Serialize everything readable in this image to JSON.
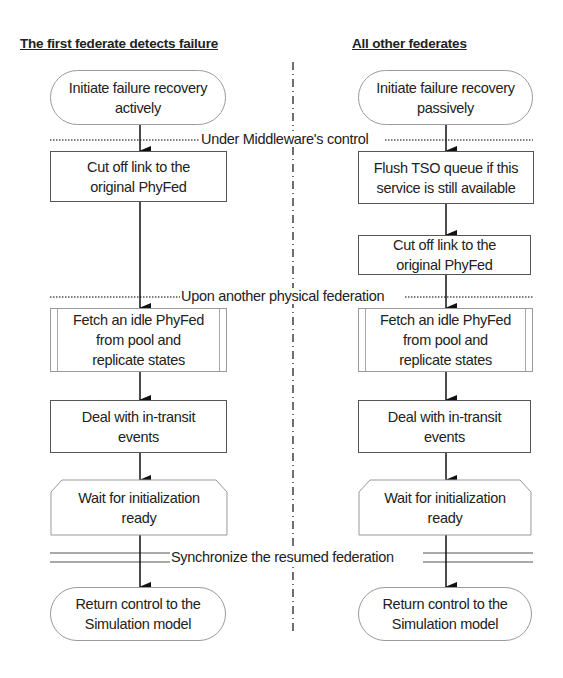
{
  "diagram": {
    "lanes": [
      {
        "id": "left",
        "header": "The first federate detects failure",
        "steps": [
          {
            "shape": "terminator",
            "text": "Initiate failure recovery actively",
            "lines": [
              "Initiate failure recovery",
              "actively"
            ]
          },
          {
            "shape": "process",
            "text": "Cut off link to the original PhyFed",
            "lines": [
              "Cut off link to the",
              "original PhyFed"
            ]
          },
          {
            "shape": "predefined-process",
            "text": "Fetch an idle PhyFed from pool and replicate states",
            "lines": [
              "Fetch an idle PhyFed",
              "from pool and",
              "replicate states"
            ]
          },
          {
            "shape": "process",
            "text": "Deal with in-transit events",
            "lines": [
              "Deal with in-transit",
              "events"
            ]
          },
          {
            "shape": "preparation",
            "text": "Wait for initialization ready",
            "lines": [
              "Wait for initialization",
              "ready"
            ]
          },
          {
            "shape": "terminator",
            "text": "Return control to the Simulation model",
            "lines": [
              "Return control to the",
              "Simulation model"
            ]
          }
        ]
      },
      {
        "id": "right",
        "header": "All other federates",
        "steps": [
          {
            "shape": "terminator",
            "text": "Initiate failure recovery passively",
            "lines": [
              "Initiate failure recovery",
              "passively"
            ]
          },
          {
            "shape": "process",
            "text": "Flush TSO queue if this service is still available",
            "lines": [
              "Flush TSO queue if this",
              "service is still available"
            ]
          },
          {
            "shape": "process",
            "text": "Cut off link to the original PhyFed",
            "lines": [
              "Cut off link to the",
              "original PhyFed"
            ]
          },
          {
            "shape": "predefined-process",
            "text": "Fetch an idle PhyFed from pool and replicate states",
            "lines": [
              "Fetch an idle PhyFed",
              "from pool and",
              "replicate states"
            ]
          },
          {
            "shape": "process",
            "text": "Deal with in-transit events",
            "lines": [
              "Deal with in-transit",
              "events"
            ]
          },
          {
            "shape": "preparation",
            "text": "Wait for initialization ready",
            "lines": [
              "Wait for initialization",
              "ready"
            ]
          },
          {
            "shape": "terminator",
            "text": "Return control to the Simulation model",
            "lines": [
              "Return control to the",
              "Simulation model"
            ]
          }
        ]
      }
    ],
    "separators": [
      {
        "style": "dotted",
        "label": "Under Middleware's control"
      },
      {
        "style": "dotted",
        "label": "Upon another physical federation"
      },
      {
        "style": "double",
        "label": "Synchronize the resumed federation"
      }
    ],
    "divider": {
      "style": "dash-dot"
    }
  }
}
